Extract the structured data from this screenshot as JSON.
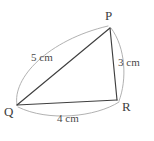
{
  "figure": {
    "kind": "triangle-diagram",
    "shape_name": "Triangle PQR",
    "background_color": "#ffffff",
    "edge_color": "#3f3f3f",
    "arc_color": "#a8a8a8",
    "label_color": "#4a4a4a"
  },
  "vertices": [
    {
      "id": "P",
      "label": "P",
      "x": 110,
      "y": 28
    },
    {
      "id": "Q",
      "label": "Q",
      "x": 17,
      "y": 105
    },
    {
      "id": "R",
      "label": "R",
      "x": 117,
      "y": 100
    }
  ],
  "sides": [
    {
      "id": "pq",
      "from": "Q",
      "to": "P",
      "label": "5 cm",
      "value": 5,
      "unit": "cm",
      "line": {
        "x1": 17,
        "y1": 105,
        "x2": 110,
        "y2": 28
      },
      "arc": "M 17 105 C 12 78, 48 40, 108 26"
    },
    {
      "id": "pr",
      "from": "P",
      "to": "R",
      "label": "3 cm",
      "value": 3,
      "unit": "cm",
      "line": {
        "x1": 110,
        "y1": 28,
        "x2": 117,
        "y2": 100
      },
      "arc": "M 111 28 C 126 48, 127 80, 119 101"
    },
    {
      "id": "qr",
      "from": "Q",
      "to": "R",
      "label": "4 cm",
      "value": 4,
      "unit": "cm",
      "line": {
        "x1": 17,
        "y1": 105,
        "x2": 117,
        "y2": 100
      },
      "arc": "M 18 107 C 48 122, 96 117, 119 102"
    }
  ]
}
